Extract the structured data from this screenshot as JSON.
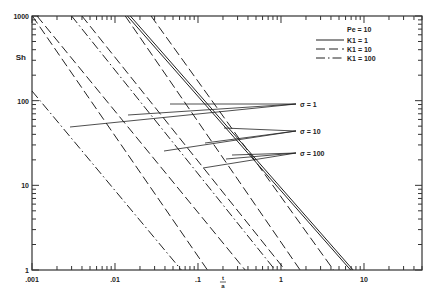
{
  "chart_data": {
    "type": "line",
    "title": "",
    "xlabel": "t/a",
    "ylabel": "Sh",
    "xscale": "log",
    "yscale": "log",
    "xlim": [
      0.001,
      50
    ],
    "ylim": [
      1,
      1000
    ],
    "grid": false,
    "x_ticks": [
      ".001",
      ".01",
      ".1",
      "1",
      "10"
    ],
    "y_ticks": [
      "1",
      "10",
      "100",
      "1000"
    ],
    "legend": {
      "position": "upper right",
      "header": "Pe = 10",
      "entries": [
        {
          "label": "K1 = 1",
          "style": "solid"
        },
        {
          "label": "K1 = 10",
          "style": "dashed"
        },
        {
          "label": "K1 = 100",
          "style": "dashdot"
        }
      ]
    },
    "annotations": [
      {
        "text": "σ = 1",
        "x": 2.0,
        "y": 58
      },
      {
        "text": "σ = 10",
        "x": 2.0,
        "y": 28
      },
      {
        "text": "σ = 100",
        "x": 2.0,
        "y": 15
      }
    ],
    "series": [
      {
        "name": "σ=1, K1=1",
        "style": "solid",
        "points": [
          [
            0.0153,
            1000
          ],
          [
            7.4,
            1
          ]
        ]
      },
      {
        "name": "σ=1, K1=10",
        "style": "solid",
        "points": [
          [
            0.0141,
            1000
          ],
          [
            6.9,
            1
          ]
        ]
      },
      {
        "name": "σ=1, K1=100",
        "style": "dashed",
        "points": [
          [
            0.0272,
            1000
          ],
          [
            4.3,
            1
          ]
        ]
      },
      {
        "name": "σ=10, K1=1",
        "style": "dashed",
        "points": [
          [
            0.0133,
            1000
          ],
          [
            1.7,
            1
          ]
        ]
      },
      {
        "name": "σ=10, K1=10",
        "style": "dashed",
        "points": [
          [
            0.004,
            1000
          ],
          [
            1.12,
            1
          ]
        ]
      },
      {
        "name": "σ=10, K1=100",
        "style": "dashdot",
        "points": [
          [
            0.003,
            1000
          ],
          [
            0.85,
            1
          ]
        ]
      },
      {
        "name": "σ=100, K1=1",
        "style": "dashed",
        "points": [
          [
            0.00115,
            1000
          ],
          [
            0.37,
            1
          ]
        ]
      },
      {
        "name": "σ=100, K1=10",
        "style": "dashed",
        "points": [
          [
            0.00101,
            1000
          ],
          [
            0.13,
            1
          ]
        ]
      },
      {
        "name": "σ=100, K1=100",
        "style": "dashdot",
        "points": [
          [
            0.001,
            130
          ],
          [
            0.063,
            1
          ]
        ]
      }
    ]
  }
}
